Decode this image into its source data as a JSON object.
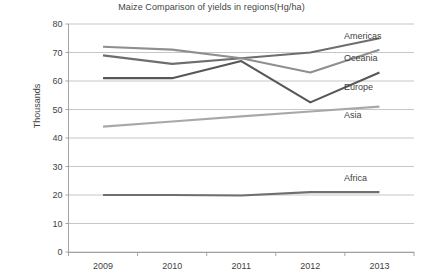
{
  "chart_data": {
    "type": "line",
    "title": "Maize Comparison of yields in regions(Hg/ha)",
    "xlabel": "",
    "ylabel": "Thousands",
    "categories": [
      "2009",
      "2010",
      "2011",
      "2012",
      "2013"
    ],
    "x": [
      2009,
      2010,
      2011,
      2012,
      2013
    ],
    "ylim": [
      0,
      80
    ],
    "yticks": [
      0,
      10,
      20,
      30,
      40,
      50,
      60,
      70,
      80
    ],
    "grid": true,
    "legend_position": "right-inline-labels",
    "series": [
      {
        "name": "Americas",
        "values": [
          69,
          66,
          68,
          70,
          75
        ],
        "color": "#6e6e6e"
      },
      {
        "name": "Oceania",
        "values": [
          72,
          71,
          68,
          63,
          71
        ],
        "color": "#8f8f8f"
      },
      {
        "name": "Europe",
        "values": [
          61,
          61,
          67,
          52.5,
          63
        ],
        "color": "#575757"
      },
      {
        "name": "Asia",
        "values": [
          44,
          45.8,
          47.6,
          49.3,
          51
        ],
        "color": "#a8a8a8"
      },
      {
        "name": "Africa",
        "values": [
          20,
          20,
          19.8,
          21,
          21
        ],
        "color": "#6f6f6f"
      }
    ],
    "annotations": [
      {
        "text": "Americas",
        "value": 76
      },
      {
        "text": "Oceania",
        "value": 68
      },
      {
        "text": "Europe",
        "value": 58
      },
      {
        "text": "Asia",
        "value": 48
      },
      {
        "text": "Africa",
        "value": 26
      }
    ]
  },
  "colors": {
    "background": "#ffffff",
    "gridline": "#b9b9b9",
    "axis": "#9a9a9a",
    "text": "#3f3f3f"
  }
}
